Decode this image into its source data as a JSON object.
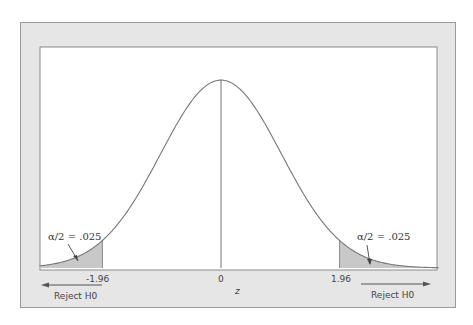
{
  "chart_data": {
    "type": "area",
    "title": "",
    "xlabel": "z",
    "ylabel": "",
    "distribution": "standard normal",
    "x_range": [
      -3.0,
      3.6
    ],
    "critical_values": [
      -1.96,
      1.96
    ],
    "center_value": 0,
    "tick_labels": [
      "-1.96",
      "0",
      "1.96"
    ],
    "tail_area_each": 0.025,
    "annotations": [
      {
        "text": "α/2 = .025",
        "tail": "left"
      },
      {
        "text": "α/2 = .025",
        "tail": "right"
      },
      {
        "text": "Reject H0",
        "side": "left",
        "arrow": "left"
      },
      {
        "text": "Reject H0",
        "side": "right",
        "arrow": "right"
      }
    ],
    "grid": false,
    "legend": null,
    "colors": {
      "panel": "#e6e6e6",
      "plot_bg": "#ffffff",
      "curve": "#777777",
      "shade": "#c8c8c8"
    }
  },
  "labels": {
    "tick_neg": "-1.96",
    "tick_zero": "0",
    "tick_pos": "1.96",
    "xlabel": "z",
    "alpha_left": "α/2 = .025",
    "alpha_right": "α/2 = .025",
    "reject_left": "Reject H0",
    "reject_right": "Reject H0"
  }
}
